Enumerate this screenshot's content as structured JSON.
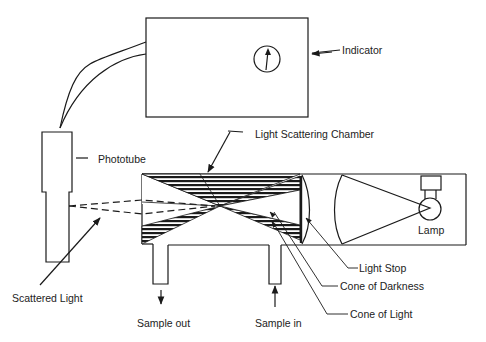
{
  "diagram": {
    "type": "light scattering photometer schematic",
    "components": [
      {
        "id": "indicator",
        "label": "Indicator"
      },
      {
        "id": "phototube",
        "label": "Phototube"
      },
      {
        "id": "chamber",
        "label": "Light Scattering Chamber"
      },
      {
        "id": "lamp",
        "label": "Lamp"
      },
      {
        "id": "light_stop",
        "label": "Light Stop"
      },
      {
        "id": "cone_darkness",
        "label": "Cone of Darkness"
      },
      {
        "id": "cone_light",
        "label": "Cone of Light"
      },
      {
        "id": "scattered_light",
        "label": "Scattered Light"
      },
      {
        "id": "sample_out",
        "label": "Sample out"
      },
      {
        "id": "sample_in",
        "label": "Sample in"
      }
    ]
  },
  "labels": {
    "indicator": "Indicator",
    "phototube": "Phototube",
    "chamber": "Light Scattering Chamber",
    "lamp": "Lamp",
    "light_stop": "Light Stop",
    "cone_darkness": "Cone of Darkness",
    "cone_light": "Cone of Light",
    "scattered_light": "Scattered Light",
    "sample_out": "Sample out",
    "sample_in": "Sample in"
  },
  "colors": {
    "ink": "#1a1a1a",
    "background": "#ffffff"
  }
}
